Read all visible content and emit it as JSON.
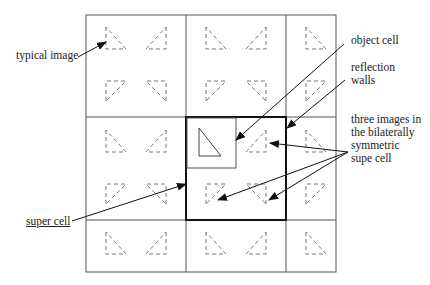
{
  "labels": {
    "typical_image": "typical image",
    "object_cell": "object cell",
    "reflection_walls_1": "reflection",
    "reflection_walls_2": "walls",
    "three_images_1": "three images in",
    "three_images_2": "the bilaterally",
    "three_images_3": "symmetric",
    "three_images_4": "supe cell",
    "super_cell": "super cell"
  },
  "colors": {
    "line": "#333333",
    "grid": "#555555",
    "dash": "#666666",
    "text": "#222222"
  }
}
